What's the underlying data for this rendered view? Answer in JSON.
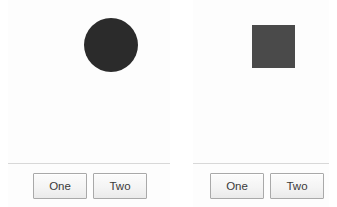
{
  "panels": [
    {
      "name": "circle-panel",
      "shape": {
        "kind": "circle",
        "label": "circle-shape",
        "color": "#2b2b2b"
      },
      "buttons": [
        {
          "label": "One"
        },
        {
          "label": "Two"
        }
      ]
    },
    {
      "name": "square-panel",
      "shape": {
        "kind": "square",
        "label": "square-shape",
        "color": "#4a4a4a"
      },
      "buttons": [
        {
          "label": "One"
        },
        {
          "label": "Two"
        }
      ]
    }
  ],
  "colors": {
    "page_background": "#ffffff",
    "panel_background": "#fdfdfd",
    "separator": "#d8d8d8",
    "button_border": "#a9a9a9",
    "button_text": "#3a3a3a"
  }
}
